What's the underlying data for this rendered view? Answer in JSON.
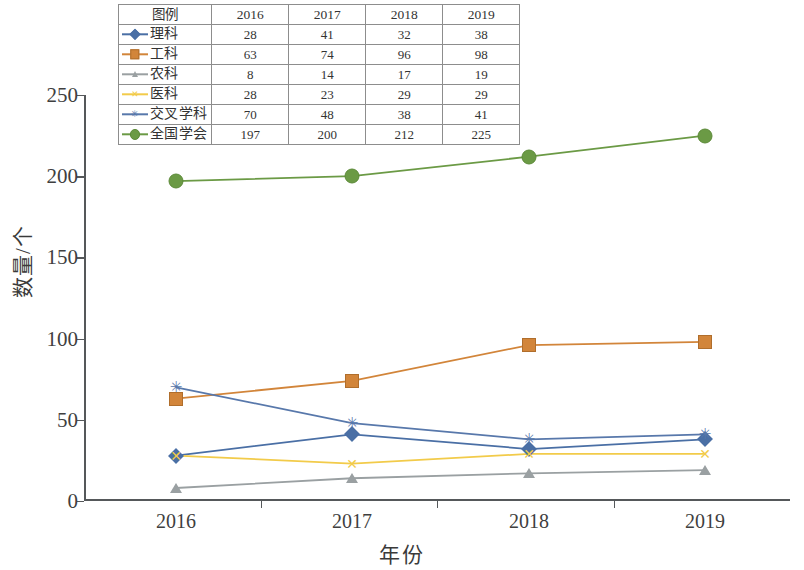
{
  "chart_data": {
    "type": "line",
    "title": "",
    "xlabel": "年份",
    "ylabel": "数量/个",
    "categories": [
      "2016",
      "2017",
      "2018",
      "2019"
    ],
    "ylim": [
      0,
      250
    ],
    "yticks": [
      0,
      50,
      100,
      150,
      200,
      250
    ],
    "grid": false,
    "legend_position": "top-inset-table",
    "legend_header_label": "图例",
    "series": [
      {
        "name": "理科",
        "values": [
          28,
          41,
          32,
          38
        ],
        "color": "#4a6fa5",
        "marker": "diamond"
      },
      {
        "name": "工科",
        "values": [
          63,
          74,
          96,
          98
        ],
        "color": "#d2853a",
        "marker": "square"
      },
      {
        "name": "农科",
        "values": [
          8,
          14,
          17,
          19
        ],
        "color": "#9aa0a2",
        "marker": "triangle"
      },
      {
        "name": "医科",
        "values": [
          28,
          23,
          29,
          29
        ],
        "color": "#f2cb4a",
        "marker": "cross"
      },
      {
        "name": "交叉学科",
        "values": [
          70,
          48,
          38,
          41
        ],
        "color": "#5878ab",
        "marker": "star"
      },
      {
        "name": "全国学会",
        "values": [
          197,
          200,
          212,
          225
        ],
        "color": "#6b9a45",
        "marker": "circle"
      }
    ]
  },
  "axis": {
    "ytick_labels": [
      "0",
      "50",
      "100",
      "150",
      "200",
      "250"
    ],
    "xtick_labels": [
      "2016",
      "2017",
      "2018",
      "2019"
    ],
    "y_title": "数量/个",
    "x_title": "年份"
  },
  "legend_table": {
    "header": [
      "图例",
      "2016",
      "2017",
      "2018",
      "2019"
    ],
    "rows": [
      {
        "label": "理科",
        "values": [
          "28",
          "41",
          "32",
          "38"
        ]
      },
      {
        "label": "工科",
        "values": [
          "63",
          "74",
          "96",
          "98"
        ]
      },
      {
        "label": "农科",
        "values": [
          "8",
          "14",
          "17",
          "19"
        ]
      },
      {
        "label": "医科",
        "values": [
          "28",
          "23",
          "29",
          "29"
        ]
      },
      {
        "label": "交叉学科",
        "values": [
          "70",
          "48",
          "38",
          "41"
        ]
      },
      {
        "label": "全国学会",
        "values": [
          "197",
          "200",
          "212",
          "225"
        ]
      }
    ]
  },
  "colors": {
    "axis": "#55585a",
    "text": "#3a3a3a",
    "table_border": "#8d8d8d",
    "background": "#ffffff"
  },
  "glyphs": {
    "cross": "✕",
    "star": "✳"
  }
}
